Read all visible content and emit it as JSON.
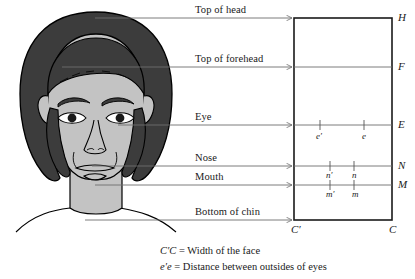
{
  "figure": {
    "type": "annotated-face-proportions-diagram",
    "row_labels": [
      {
        "text": "Top of head",
        "key": "H"
      },
      {
        "text": "Top of forehead",
        "key": "F"
      },
      {
        "text": "Eye",
        "key": "E"
      },
      {
        "text": "Nose",
        "key": "N"
      },
      {
        "text": "Mouth",
        "key": "M"
      },
      {
        "text": "Bottom of chin",
        "key": "C"
      }
    ],
    "right_axis_labels": [
      "H",
      "F",
      "E",
      "N",
      "M"
    ],
    "corner_labels": {
      "bottom_left": "C′",
      "bottom_right": "C"
    },
    "tick_labels": {
      "eye_left": "e′",
      "eye_right": "e",
      "nose_left": "n′",
      "nose_right": "n",
      "mouth_left": "m′",
      "mouth_right": "m"
    },
    "captions": [
      {
        "symbol": "C′C",
        "text": "= Width of the face"
      },
      {
        "symbol": "e′e",
        "text": "= Distance between outsides of eyes"
      }
    ],
    "colors": {
      "hair": "#3c3c3c",
      "skin": "#c3c3c3",
      "outline": "#000000",
      "rule_line": "#6e6e6e",
      "box_border": "#1a1a1a",
      "background": "#ffffff"
    }
  }
}
